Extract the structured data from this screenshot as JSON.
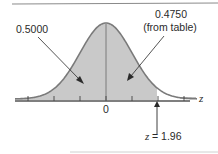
{
  "diagram": {
    "type": "normal-distribution",
    "mean": 0,
    "shaded_upper_z": 1.96,
    "ticks_z": [
      -3,
      -2,
      -1,
      0,
      1,
      2,
      3
    ],
    "axis_variable": "z",
    "zero_label": "0",
    "annotations": {
      "left_area": "0.5000",
      "right_area_value": "0.4750",
      "right_area_note": "(from table)",
      "z_prefix": "z",
      "z_equals": "= 1.96"
    },
    "colors": {
      "fill": "#c9c9c9",
      "curve": "#7a7a7a",
      "axis": "#555555",
      "text": "#2a2a2a",
      "frame": "#8a8a8a"
    }
  }
}
